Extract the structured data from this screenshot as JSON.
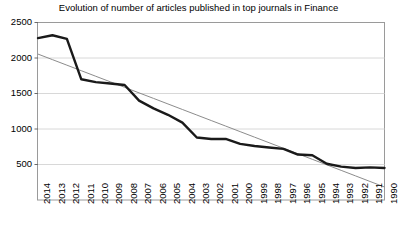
{
  "chart_data": {
    "type": "line",
    "title": "Evolution of number of articles published in top journals in Finance",
    "xlabel": "",
    "ylabel": "",
    "grid": true,
    "legend_position": "none",
    "xlim_categories_order": "descending-years",
    "ylim": [
      0,
      2500
    ],
    "yticks": [
      500,
      1000,
      1500,
      2000,
      2500
    ],
    "categories": [
      "2014",
      "2013",
      "2012",
      "2011",
      "2010",
      "2009",
      "2008",
      "2007",
      "2006",
      "2005",
      "2004",
      "2003",
      "2002",
      "2001",
      "2000",
      "1999",
      "1998",
      "1997",
      "1996",
      "1995",
      "1994",
      "1993",
      "1992",
      "1991",
      "1990"
    ],
    "series": [
      {
        "name": "Number of articles",
        "color": "#1a1a1a",
        "style": "thick-line",
        "values": [
          2280,
          2320,
          2270,
          1700,
          1660,
          1640,
          1620,
          1400,
          1290,
          1200,
          1090,
          880,
          860,
          860,
          790,
          760,
          740,
          720,
          640,
          630,
          510,
          470,
          450,
          460,
          450
        ]
      },
      {
        "name": "Linear trend",
        "color": "#8c8c8c",
        "style": "thin-line",
        "values": [
          2055,
          1977,
          1899,
          1821,
          1743,
          1665,
          1587,
          1509,
          1431,
          1353,
          1275,
          1197,
          1119,
          1041,
          963,
          885,
          807,
          729,
          651,
          573,
          495,
          417,
          339,
          261,
          183
        ]
      }
    ]
  },
  "axes": {
    "y_tick_labels": [
      "2500",
      "2000",
      "1500",
      "1000",
      "500"
    ],
    "x_tick_labels": [
      "2014",
      "2013",
      "2012",
      "2011",
      "2010",
      "2009",
      "2008",
      "2007",
      "2006",
      "2005",
      "2004",
      "2003",
      "2002",
      "2001",
      "2000",
      "1999",
      "1998",
      "1997",
      "1996",
      "1995",
      "1994",
      "1993",
      "1992",
      "1991",
      "1990"
    ]
  }
}
